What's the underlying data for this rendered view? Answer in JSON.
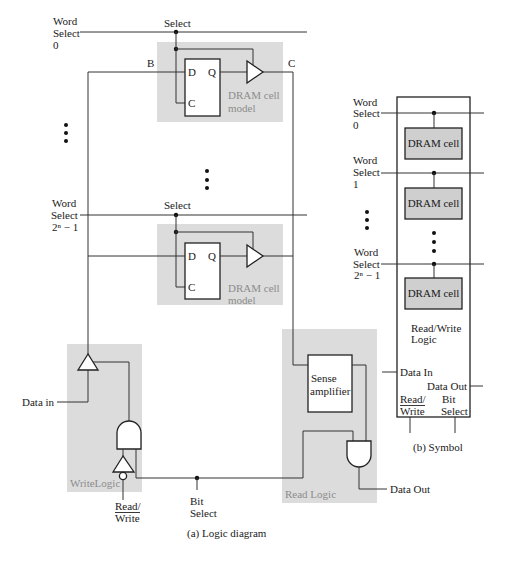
{
  "logic_diagram": {
    "caption": "(a) Logic diagram",
    "word_select_top": {
      "line1": "Word",
      "line2": "Select",
      "line3": "0"
    },
    "word_select_bottom": {
      "line1": "Word",
      "line2": "Select",
      "line3": "2ⁿ − 1"
    },
    "node_b": "B",
    "node_c": "C",
    "cells": [
      {
        "select_label": "Select",
        "d": "D",
        "q": "Q",
        "c": "C",
        "model_line1": "DRAM cell",
        "model_line2": "model"
      },
      {
        "select_label": "Select",
        "d": "D",
        "q": "Q",
        "c": "C",
        "model_line1": "DRAM cell",
        "model_line2": "model"
      }
    ],
    "write_logic": {
      "label": "WriteLogic",
      "data_in": "Data in",
      "read_write_line1": "Read/",
      "read_write_line2": "Write"
    },
    "bit_select": {
      "line1": "Bit",
      "line2": "Select"
    },
    "read_logic": {
      "label": "Read Logic",
      "sense_line1": "Sense",
      "sense_line2": "amplifier",
      "data_out": "Data Out"
    }
  },
  "symbol": {
    "caption": "(b) Symbol",
    "word_selects": [
      {
        "line1": "Word",
        "line2": "Select",
        "line3": "0"
      },
      {
        "line1": "Word",
        "line2": "Select",
        "line3": "1"
      },
      {
        "line1": "Word",
        "line2": "Select",
        "line3": "2ⁿ − 1"
      }
    ],
    "cells": [
      "DRAM cell",
      "DRAM cell",
      "DRAM cell"
    ],
    "logic_line1": "Read/Write",
    "logic_line2": "Logic",
    "data_in": "Data In",
    "data_out": "Data Out",
    "read_write_line1": "Read/",
    "read_write_line2": "Write",
    "bit_select_line1": "Bit",
    "bit_select_line2": "Select"
  },
  "colors": {
    "wire": "#333333",
    "shaded_region": "#dcdcdc",
    "dram_cell_fill": "#cfcfcf",
    "region_label": "#8c8c8c"
  }
}
